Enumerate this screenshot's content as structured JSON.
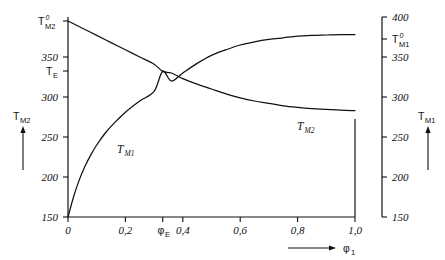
{
  "figure": {
    "background": "#ffffff",
    "ink": "#111111"
  },
  "axes": {
    "left": {
      "name": "T_M2",
      "arrow_label_main": "T",
      "arrow_label_sub": "M2",
      "ticks": [
        "150",
        "200",
        "250",
        "300",
        "350"
      ],
      "special_labels": [
        {
          "text_main": "T",
          "sup": "0",
          "sub": "M2",
          "value": 395
        },
        {
          "text_main": "T",
          "sub": "E",
          "value": 332
        }
      ],
      "range": [
        150,
        400
      ]
    },
    "right": {
      "name": "T_M1",
      "arrow_label_main": "T",
      "arrow_label_sub": "M1",
      "ticks": [
        "150",
        "200",
        "250",
        "300",
        "350",
        "400"
      ],
      "special_labels": [
        {
          "text_main": "T",
          "sup": "0",
          "sub": "M1",
          "value": 378
        }
      ],
      "range": [
        150,
        400
      ]
    },
    "bottom": {
      "name": "phi_1",
      "arrow_label_main": "φ",
      "arrow_label_sub": "1",
      "ticks": [
        "0",
        "0,2",
        "0,4",
        "0,6",
        "0,8",
        "1,0"
      ],
      "tick_values": [
        0,
        0.2,
        0.4,
        0.6,
        0.8,
        1.0
      ],
      "special_labels": [
        {
          "text_main": "φ",
          "sub": "E",
          "value": 0.33
        }
      ],
      "range": [
        0,
        1.0
      ]
    }
  },
  "curves": [
    {
      "name": "T_M1",
      "label_main": "T",
      "label_sub": "M1"
    },
    {
      "name": "T_M2",
      "label_main": "T",
      "label_sub": "M2"
    }
  ],
  "chart_data": {
    "type": "line",
    "title": "",
    "xlabel": "φ₁",
    "ylabel": "T_M2 (left) / T_M1 (right)",
    "xlim": [
      0,
      1.0
    ],
    "ylim": [
      150,
      400
    ],
    "grid": false,
    "legend": "inline-curve-labels",
    "xticks": [
      0,
      0.2,
      0.4,
      0.6,
      0.8,
      1.0
    ],
    "xticklabels": [
      "0",
      "0,2",
      "0,4",
      "0,6",
      "0,8",
      "1,0"
    ],
    "yticks_left": [
      150,
      200,
      250,
      300,
      350
    ],
    "yticklabels_left": [
      "150",
      "200",
      "250",
      "300",
      "350"
    ],
    "yticks_right": [
      150,
      200,
      250,
      300,
      350,
      400
    ],
    "yticklabels_right": [
      "150",
      "200",
      "250",
      "300",
      "350",
      "400"
    ],
    "annotations": [
      {
        "text": "T⁰_M2",
        "x": 0.0,
        "y": 395
      },
      {
        "text": "T_E",
        "x": 0.0,
        "y": 332
      },
      {
        "text": "T⁰_M1",
        "x": 1.0,
        "y": 378
      },
      {
        "text": "φ_E",
        "x": 0.33,
        "y": 150
      },
      {
        "text": "T_M1",
        "x": 0.18,
        "y": 232
      },
      {
        "text": "T_M2",
        "x": 0.67,
        "y": 265
      }
    ],
    "series": [
      {
        "name": "T_M1",
        "x": [
          0.0,
          0.02,
          0.04,
          0.06,
          0.08,
          0.1,
          0.13,
          0.16,
          0.2,
          0.25,
          0.3,
          0.33,
          0.36,
          0.4,
          0.45,
          0.5,
          0.55,
          0.6,
          0.65,
          0.7,
          0.75,
          0.8,
          0.85,
          0.9,
          0.95,
          1.0
        ],
        "y": [
          150,
          176,
          197,
          214,
          228,
          240,
          255,
          267,
          281,
          295,
          307,
          332,
          320,
          330,
          342,
          352,
          359,
          365,
          369,
          372,
          374,
          376,
          377,
          377.5,
          378,
          378
        ]
      },
      {
        "name": "T_M2",
        "x": [
          0.0,
          0.05,
          0.1,
          0.15,
          0.2,
          0.25,
          0.3,
          0.33,
          0.36,
          0.4,
          0.45,
          0.5,
          0.55,
          0.6,
          0.65,
          0.7,
          0.75,
          0.8,
          0.85,
          0.9,
          0.95,
          1.0
        ],
        "y": [
          395,
          386,
          377,
          368,
          359,
          350,
          341,
          332,
          330,
          323,
          316,
          310,
          304,
          299,
          295,
          292,
          289,
          287,
          285.5,
          284.5,
          283.5,
          283
        ]
      }
    ],
    "intersection": {
      "x": 0.33,
      "y": 332,
      "label": "eutectic point"
    }
  }
}
